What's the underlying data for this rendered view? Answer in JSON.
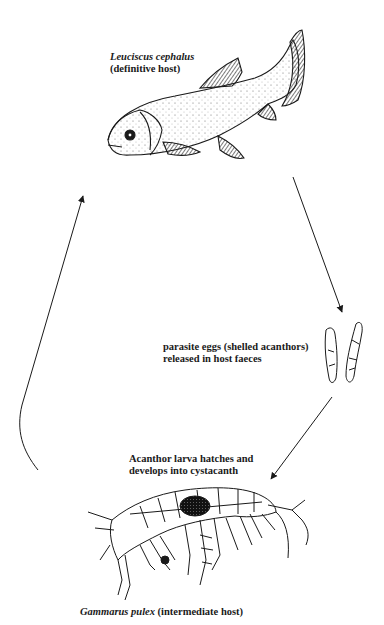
{
  "diagram": {
    "type": "life-cycle",
    "colors": {
      "line": "#1a1a1a",
      "background": "#ffffff"
    },
    "nodes": {
      "definitive_host": {
        "species": "Leuciscus cephalus",
        "role": "(definitive host)",
        "icon": "fish-icon"
      },
      "eggs": {
        "line1": "parasite eggs (shelled acanthors)",
        "line2": "released in host faeces",
        "icon": "parasite-egg-icon"
      },
      "larva": {
        "line1": "Acanthor larva hatches and",
        "line2": "develops into cystacanth"
      },
      "intermediate_host": {
        "species": "Gammarus pulex",
        "role": "(intermediate host)",
        "icon": "amphipod-icon"
      }
    },
    "edges": [
      {
        "from": "definitive_host",
        "to": "eggs"
      },
      {
        "from": "eggs",
        "to": "intermediate_host"
      },
      {
        "from": "intermediate_host",
        "to": "definitive_host"
      }
    ]
  }
}
